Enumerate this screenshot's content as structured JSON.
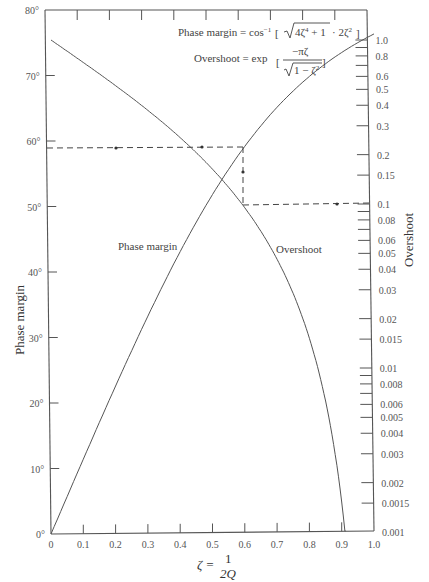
{
  "chart_data": {
    "type": "line",
    "title": "",
    "xlabel": "ζ = 1/2Q",
    "xlabel_parts": {
      "lhs": "ζ =",
      "num": "1",
      "den": "2Q"
    },
    "ylabel": "Phase margin",
    "ylabel_right": "Overshoot",
    "xlim": [
      0,
      1.0
    ],
    "ylim": [
      0,
      80
    ],
    "ylim_right": [
      0.001,
      1.0
    ],
    "yscale_right": "log",
    "x_ticks": [
      "0",
      "0.1",
      "0.2",
      "0.3",
      "0.4",
      "0.5",
      "0.6",
      "0.7",
      "0.8",
      "0.9",
      "1.0"
    ],
    "y_ticks": [
      "0°",
      "10°",
      "20°",
      "30°",
      "40°",
      "50°",
      "60°",
      "70°",
      "80°"
    ],
    "y_ticks_right": [
      "1.0",
      "0.8",
      "0.6",
      "0.5",
      "0.4",
      "0.3",
      "0.2",
      "0.15",
      "0.1",
      "0.08",
      "0.06",
      "0.05",
      "0.04",
      "0.03",
      "0.02",
      "0.015",
      "0.01",
      "0.008",
      "0.006",
      "0.005",
      "0.004",
      "0.003",
      "0.002",
      "0.0015",
      "0.001"
    ],
    "grid": false,
    "legend": "none",
    "formulas": {
      "phase_margin": "Phase margin = cos⁻¹ [ √(4ζ⁴ + 1) − 2ζ² ]",
      "overshoot": "Overshoot = exp [ −πζ / √(1 − ζ²) ]"
    },
    "x": [
      0,
      0.1,
      0.2,
      0.3,
      0.4,
      0.5,
      0.6,
      0.7,
      0.8,
      0.9,
      1.0
    ],
    "series": [
      {
        "name": "Phase margin",
        "axis": "left",
        "unit": "degrees",
        "values": [
          0,
          11.4,
          22.6,
          33.0,
          43.1,
          51.8,
          59.2,
          65.2,
          69.9,
          73.5,
          76.3
        ]
      },
      {
        "name": "Overshoot",
        "axis": "right",
        "unit": "ratio",
        "values": [
          1.0,
          0.729,
          0.527,
          0.372,
          0.254,
          0.163,
          0.095,
          0.046,
          0.0152,
          0.0015,
          null
        ]
      }
    ],
    "annotations": [
      {
        "type": "dashed-path",
        "description": "From phase margin ≈59° across to ζ≈0.59, down to overshoot 0.1, across to right axis",
        "phase_margin_deg": 59,
        "zeta": 0.59,
        "overshoot": 0.1
      }
    ],
    "curve_labels": {
      "phase_margin": "Phase margin",
      "overshoot": "Overshoot"
    }
  }
}
